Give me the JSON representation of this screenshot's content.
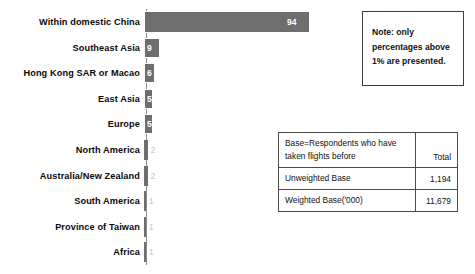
{
  "chart_data": {
    "type": "bar",
    "orientation": "horizontal",
    "title": "",
    "xlabel": "",
    "ylabel": "",
    "xlim": [
      0,
      100
    ],
    "grid": false,
    "legend": null,
    "value_suffix": "%",
    "categories": [
      "Within domestic China",
      "Southeast Asia",
      "Hong Kong SAR or Macao",
      "East Asia",
      "Europe",
      "North America",
      "Australia/New Zealand",
      "South America",
      "Province of Taiwan",
      "Africa"
    ],
    "values": [
      94,
      9,
      6,
      5,
      5,
      2,
      2,
      1,
      1,
      1
    ],
    "labels": [
      "94",
      "9",
      "6",
      "5",
      "5",
      "2",
      "2",
      "1",
      "1",
      "1"
    ],
    "bar_color": "#6e6e6e"
  },
  "note": {
    "name": "note-box",
    "lines": [
      "Note: only",
      "percentages above",
      "1% are presented."
    ]
  },
  "base_table": {
    "header_label_line1": "Base=Respondents who have",
    "header_label_line2": "taken flights before",
    "header_total": "Total",
    "rows": [
      {
        "label": "Unweighted Base",
        "total": "1,194"
      },
      {
        "label": "Weighted Base('000)",
        "total": "11,679"
      }
    ]
  }
}
